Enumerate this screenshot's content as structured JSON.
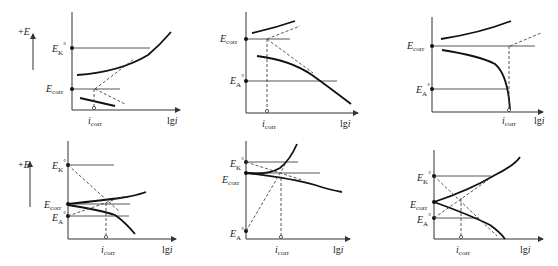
{
  "figure": {
    "type": "Evans polarization diagrams",
    "panels": [
      {
        "id": "a",
        "labels": [
          "+E",
          "E°K",
          "Ecorr",
          "icorr",
          "lgi"
        ],
        "control": "cathodic"
      },
      {
        "id": "b",
        "labels": [
          "Ecorr",
          "E°A",
          "icorr",
          "lgi"
        ],
        "control": "anodic"
      },
      {
        "id": "c",
        "labels": [
          "Ecorr",
          "E°A",
          "icorr",
          "lgi"
        ],
        "control": "anodic-passivation"
      },
      {
        "id": "d",
        "labels": [
          "+E",
          "E°K",
          "Ecorr",
          "E°A",
          "icorr",
          "lgi"
        ],
        "control": "mixed"
      },
      {
        "id": "e",
        "labels": [
          "E°K",
          "Ecorr",
          "E°A",
          "icorr",
          "lgi"
        ],
        "control": "cathodic-near"
      },
      {
        "id": "f",
        "labels": [
          "E°K",
          "Ecorr",
          "E°A",
          "icorr",
          "lgi"
        ],
        "control": "mixed-symmetric"
      }
    ]
  },
  "labels": {
    "plus_e": "+E",
    "e_main": "E",
    "k_sub": "K",
    "a_sub": "A",
    "corr_sub": "corr",
    "i": "i",
    "lg": "lg",
    "deg": "°"
  }
}
